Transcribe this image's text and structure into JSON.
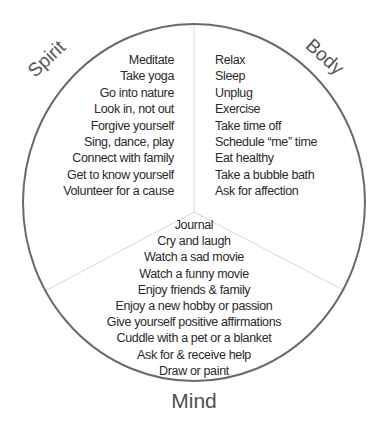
{
  "diagram": {
    "type": "three-section wheel",
    "colors": {
      "circle_stroke": "#6a6a6a",
      "divider_stroke": "#d8d8d8",
      "text": "#2a2a2a",
      "label_text": "#555555",
      "background": "#ffffff"
    },
    "sections": {
      "spirit": {
        "label": "Spirit",
        "items": [
          "Meditate",
          "Take yoga",
          "Go into nature",
          "Look in, not out",
          "Forgive yourself",
          "Sing, dance, play",
          "Connect with family",
          "Get to know yourself",
          "Volunteer for a cause"
        ]
      },
      "body": {
        "label": "Body",
        "items": [
          "Relax",
          "Sleep",
          "Unplug",
          "Exercise",
          "Take time off",
          "Schedule “me” time",
          "Eat healthy",
          "Take a bubble bath",
          "Ask for affection"
        ]
      },
      "mind": {
        "label": "Mind",
        "items": [
          "Journal",
          "Cry and laugh",
          "Watch a sad movie",
          "Watch a funny movie",
          "Enjoy friends & family",
          "Enjoy a new hobby or passion",
          "Give yourself positive affirmations",
          "Cuddle with a pet or a blanket",
          "Ask for & receive help",
          "Draw or paint"
        ]
      }
    }
  }
}
